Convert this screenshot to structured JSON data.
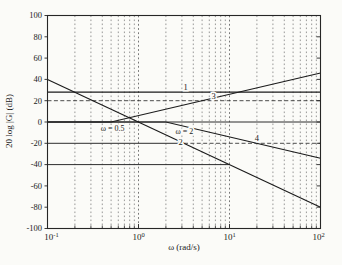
{
  "colors": {
    "background": "#fbfbf8",
    "line": "#1b1b1b",
    "grid_minor": "#6e6e6e",
    "grid_major": "#555555",
    "reference": "#2d2d2d",
    "frame": "#262626",
    "text": "#1a1a1a"
  },
  "chart_data": {
    "type": "line",
    "subtype": "bode-magnitude-asymptotes",
    "xlabel": "ω (rad/s)",
    "ylabel": "20 log |G| (dB)",
    "x_scale": "log",
    "xlim": [
      0.1,
      100
    ],
    "ylim": [
      -100,
      100
    ],
    "grid": "vertical dashed, minor and major decades",
    "legend_position": "none",
    "x_ticks": [
      {
        "value": 0.1,
        "base": "10",
        "exp": "-1"
      },
      {
        "value": 1,
        "base": "10",
        "exp": "0"
      },
      {
        "value": 10,
        "base": "10",
        "exp": "1"
      },
      {
        "value": 100,
        "base": "10",
        "exp": "2"
      }
    ],
    "y_ticks": [
      {
        "value": 100,
        "label": "100"
      },
      {
        "value": 80,
        "label": "80"
      },
      {
        "value": 60,
        "label": "60"
      },
      {
        "value": 40,
        "label": "40"
      },
      {
        "value": 20,
        "label": "20"
      },
      {
        "value": 0,
        "label": "0"
      },
      {
        "value": -20,
        "label": "-20"
      },
      {
        "value": -40,
        "label": "-40"
      },
      {
        "value": -60,
        "label": "-60"
      },
      {
        "value": -80,
        "label": "-80"
      },
      {
        "value": -100,
        "label": "-100"
      }
    ],
    "series": [
      {
        "name": "1",
        "points": [
          [
            0.1,
            28
          ],
          [
            100,
            28
          ]
        ],
        "slope_db_per_decade": 0
      },
      {
        "name": "2",
        "points": [
          [
            0.1,
            40
          ],
          [
            100,
            -80
          ]
        ],
        "slope_db_per_decade": -40
      },
      {
        "name": "3",
        "points": [
          [
            0.1,
            0
          ],
          [
            0.5,
            0
          ],
          [
            100,
            46
          ]
        ],
        "break_rad_s": 0.5,
        "slope_db_per_decade": 20
      },
      {
        "name": "4",
        "points": [
          [
            0.1,
            0
          ],
          [
            2,
            0
          ],
          [
            100,
            -34
          ]
        ],
        "break_rad_s": 2,
        "slope_db_per_decade": -20
      }
    ],
    "reference_lines": [
      {
        "db": 0,
        "from": 0.1,
        "to": 100,
        "style": "solid"
      },
      {
        "db": 20,
        "from": 0.1,
        "to": 100,
        "style": "dashed"
      },
      {
        "db": -20,
        "from": 0.1,
        "to": 3.16,
        "style": "solid"
      },
      {
        "db": -20,
        "from": 3.16,
        "to": 100,
        "style": "dashed"
      },
      {
        "db": -40,
        "from": 0.1,
        "to": 10,
        "style": "solid"
      }
    ],
    "curve_labels": [
      {
        "text": "1",
        "omega": 3.3,
        "db": 33
      },
      {
        "text": "2",
        "omega": 2.9,
        "db": -19
      },
      {
        "text": "3",
        "omega": 6.7,
        "db": 24
      },
      {
        "text": "4",
        "omega": 20,
        "db": -15
      }
    ],
    "annotations": [
      {
        "text": "ω = 0.5",
        "omega": 0.52,
        "db": -5.5
      },
      {
        "text": "ω = 2",
        "omega": 3.2,
        "db": -8
      }
    ]
  }
}
